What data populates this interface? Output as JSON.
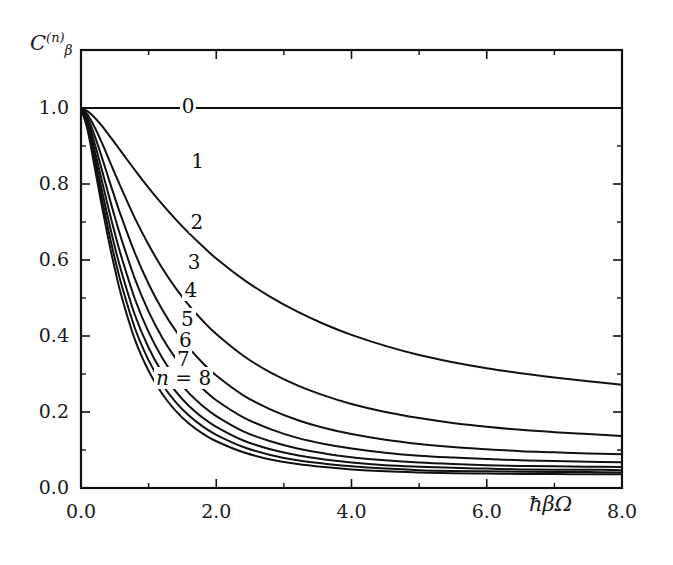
{
  "figure": {
    "background": "#ffffff",
    "line_color": "#111111",
    "frame_color": "#111111"
  },
  "axes": {
    "ylabel": "C",
    "ylabel_superscript": "(n)",
    "ylabel_subscript": "β",
    "xlabel": "ħβΩ",
    "xticks": [
      "0.0",
      "2.0",
      "4.0",
      "6.0",
      "8.0"
    ],
    "xtick_values": [
      0,
      2,
      4,
      6,
      8
    ],
    "yticks": [
      "0.0",
      "0.2",
      "0.4",
      "0.6",
      "0.8",
      "1.0"
    ],
    "ytick_values": [
      0,
      0.2,
      0.4,
      0.6,
      0.8,
      1.0
    ],
    "xlim": [
      0,
      8
    ],
    "ylim": [
      0,
      1.05
    ],
    "xminor_values": [
      1,
      3,
      5,
      7
    ],
    "yminor_values": [
      0.1,
      0.3,
      0.5,
      0.7,
      0.9
    ],
    "grid": false
  },
  "curve_labels": [
    {
      "text": "0",
      "x": 1.46,
      "y": 1.0
    },
    {
      "text": "1",
      "x": 1.6,
      "y": 0.855
    },
    {
      "text": "2",
      "x": 1.59,
      "y": 0.695
    },
    {
      "text": "3",
      "x": 1.55,
      "y": 0.59
    },
    {
      "text": "4",
      "x": 1.5,
      "y": 0.515
    },
    {
      "text": "5",
      "x": 1.45,
      "y": 0.44
    },
    {
      "text": "6",
      "x": 1.42,
      "y": 0.385
    },
    {
      "text": "7",
      "x": 1.39,
      "y": 0.335
    },
    {
      "text": "n = 8",
      "x": 1.08,
      "y": 0.285,
      "prefix": true
    }
  ],
  "chart_data": {
    "type": "line",
    "title": "",
    "xlabel": "ħβΩ",
    "ylabel": "C_β^(n)",
    "xlim": [
      0,
      8
    ],
    "ylim": [
      0,
      1.05
    ],
    "grid": false,
    "legend": "inline curve labels n = 0..8",
    "x": [
      0.0,
      0.1,
      0.2,
      0.3,
      0.4,
      0.5,
      0.6,
      0.8,
      1.0,
      1.2,
      1.4,
      1.6,
      1.8,
      2.0,
      2.4,
      2.8,
      3.2,
      3.6,
      4.0,
      4.5,
      5.0,
      5.5,
      6.0,
      6.5,
      7.0,
      7.5,
      8.0
    ],
    "series": [
      {
        "name": "0",
        "n": 0,
        "values": [
          1.0,
          1.0,
          1.0,
          1.0,
          1.0,
          1.0,
          1.0,
          1.0,
          1.0,
          1.0,
          1.0,
          1.0,
          1.0,
          1.0,
          1.0,
          1.0,
          1.0,
          1.0,
          1.0,
          1.0,
          1.0,
          1.0,
          1.0,
          1.0,
          1.0,
          1.0,
          1.0
        ]
      },
      {
        "name": "1",
        "n": 1,
        "values": [
          1.0,
          0.991,
          0.975,
          0.955,
          0.932,
          0.908,
          0.884,
          0.836,
          0.79,
          0.747,
          0.707,
          0.67,
          0.636,
          0.604,
          0.549,
          0.503,
          0.464,
          0.431,
          0.403,
          0.374,
          0.35,
          0.331,
          0.315,
          0.302,
          0.291,
          0.281,
          0.272
        ]
      },
      {
        "name": "2",
        "n": 2,
        "values": [
          1.0,
          0.982,
          0.95,
          0.912,
          0.87,
          0.828,
          0.787,
          0.709,
          0.64,
          0.579,
          0.526,
          0.48,
          0.44,
          0.405,
          0.348,
          0.304,
          0.27,
          0.243,
          0.221,
          0.2,
          0.184,
          0.171,
          0.161,
          0.153,
          0.147,
          0.142,
          0.137
        ]
      },
      {
        "name": "3",
        "n": 3,
        "values": [
          1.0,
          0.974,
          0.928,
          0.875,
          0.819,
          0.764,
          0.712,
          0.617,
          0.537,
          0.47,
          0.414,
          0.368,
          0.329,
          0.296,
          0.244,
          0.207,
          0.179,
          0.158,
          0.142,
          0.127,
          0.116,
          0.108,
          0.102,
          0.097,
          0.094,
          0.091,
          0.089
        ]
      },
      {
        "name": "4",
        "n": 4,
        "values": [
          1.0,
          0.966,
          0.908,
          0.843,
          0.777,
          0.713,
          0.654,
          0.549,
          0.464,
          0.396,
          0.341,
          0.297,
          0.261,
          0.231,
          0.186,
          0.155,
          0.132,
          0.116,
          0.104,
          0.093,
          0.085,
          0.08,
          0.076,
          0.073,
          0.071,
          0.069,
          0.068
        ]
      },
      {
        "name": "5",
        "n": 5,
        "values": [
          1.0,
          0.959,
          0.89,
          0.815,
          0.741,
          0.671,
          0.607,
          0.496,
          0.41,
          0.343,
          0.29,
          0.249,
          0.216,
          0.189,
          0.149,
          0.123,
          0.104,
          0.091,
          0.081,
          0.073,
          0.067,
          0.063,
          0.06,
          0.058,
          0.057,
          0.056,
          0.055
        ]
      },
      {
        "name": "6",
        "n": 6,
        "values": [
          1.0,
          0.952,
          0.874,
          0.79,
          0.71,
          0.635,
          0.568,
          0.454,
          0.369,
          0.304,
          0.254,
          0.215,
          0.185,
          0.161,
          0.125,
          0.102,
          0.086,
          0.075,
          0.067,
          0.06,
          0.056,
          0.053,
          0.051,
          0.049,
          0.048,
          0.048,
          0.047
        ]
      },
      {
        "name": "7",
        "n": 7,
        "values": [
          1.0,
          0.946,
          0.859,
          0.769,
          0.683,
          0.604,
          0.534,
          0.419,
          0.336,
          0.273,
          0.226,
          0.19,
          0.162,
          0.14,
          0.108,
          0.087,
          0.073,
          0.064,
          0.057,
          0.051,
          0.047,
          0.045,
          0.044,
          0.043,
          0.042,
          0.042,
          0.041
        ]
      },
      {
        "name": "n = 8",
        "n": 8,
        "values": [
          1.0,
          0.94,
          0.846,
          0.75,
          0.659,
          0.577,
          0.504,
          0.389,
          0.308,
          0.248,
          0.203,
          0.169,
          0.143,
          0.123,
          0.094,
          0.075,
          0.063,
          0.055,
          0.049,
          0.044,
          0.041,
          0.039,
          0.038,
          0.037,
          0.037,
          0.036,
          0.036
        ]
      }
    ]
  }
}
